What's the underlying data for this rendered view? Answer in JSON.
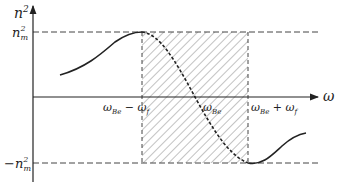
{
  "diagram": {
    "y_axis_label": "n",
    "y_axis_sup": "2",
    "x_axis_label": "ω",
    "upper_level": {
      "base": "n",
      "sup": "2",
      "sub": "m"
    },
    "lower_level": {
      "prefix": "−",
      "base": "n",
      "sup": "2",
      "sub": "m"
    },
    "x_ticks": {
      "left": {
        "base": "ω",
        "sub": "Be",
        "op": " − ",
        "base2": "ω",
        "sub2": "f"
      },
      "center": {
        "base": "ω",
        "sub": "Be"
      },
      "right": {
        "base": "ω",
        "sub": "Be",
        "op": " + ",
        "base2": "ω",
        "sub2": "f"
      }
    },
    "colors": {
      "ink": "#222222",
      "hatch": "#555555",
      "background": "#ffffff"
    }
  }
}
